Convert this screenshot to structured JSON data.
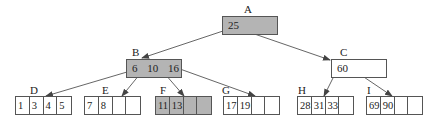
{
  "diagram": {
    "type": "b-tree",
    "highlight_color": "#b4b4b4",
    "edge_color": "#555555",
    "nodes": {
      "A": {
        "label": "A",
        "keys": [
          "25"
        ],
        "shaded": true,
        "level": "root"
      },
      "B": {
        "label": "B",
        "keys": [
          "6",
          "10",
          "16"
        ],
        "shaded": true,
        "level": "internal"
      },
      "C": {
        "label": "C",
        "keys": [
          "60"
        ],
        "shaded": false,
        "level": "internal"
      },
      "D": {
        "label": "D",
        "keys": [
          "1",
          "3",
          "4",
          "5"
        ],
        "shaded": false,
        "level": "leaf"
      },
      "E": {
        "label": "E",
        "keys": [
          "7",
          "8",
          "",
          ""
        ],
        "shaded": false,
        "level": "leaf"
      },
      "F": {
        "label": "F",
        "keys": [
          "11",
          "13",
          "",
          ""
        ],
        "shaded": true,
        "level": "leaf"
      },
      "G": {
        "label": "G",
        "keys": [
          "17",
          "19",
          "",
          ""
        ],
        "shaded": false,
        "level": "leaf"
      },
      "H": {
        "label": "H",
        "keys": [
          "28",
          "31",
          "33",
          ""
        ],
        "shaded": false,
        "level": "leaf"
      },
      "I": {
        "label": "I",
        "keys": [
          "69",
          "90",
          "",
          ""
        ],
        "shaded": false,
        "level": "leaf"
      }
    },
    "edges": [
      [
        "A",
        "B"
      ],
      [
        "A",
        "C"
      ],
      [
        "B",
        "D"
      ],
      [
        "B",
        "E"
      ],
      [
        "B",
        "F"
      ],
      [
        "B",
        "G"
      ],
      [
        "C",
        "H"
      ],
      [
        "C",
        "I"
      ]
    ]
  }
}
